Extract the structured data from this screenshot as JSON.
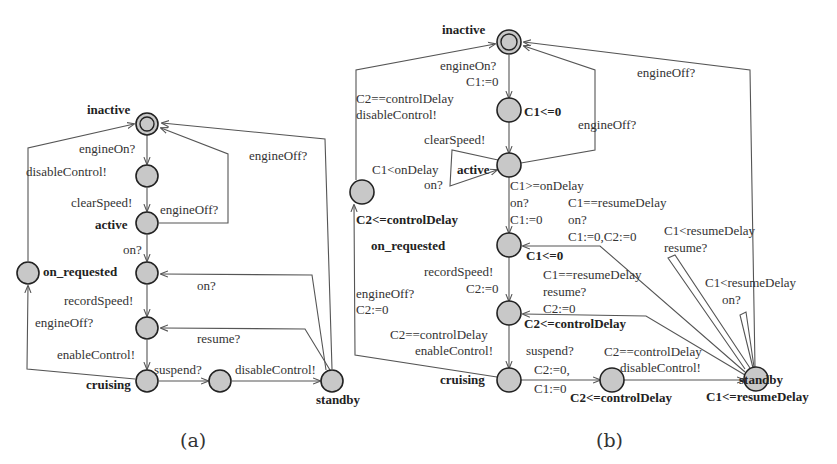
{
  "diagram_a": {
    "caption": "(a)",
    "locations": {
      "inactive": "inactive",
      "active": "active",
      "on_requested": "on_requested",
      "cruising": "cruising",
      "standby": "standby"
    },
    "edges": {
      "engineOn": "engineOn?",
      "disableControl_left": "disableControl!",
      "clearSpeed": "clearSpeed!",
      "engineOff_active": "engineOff?",
      "engineOff_top": "engineOff?",
      "on": "on?",
      "on_standby": "on?",
      "recordSpeed": "recordSpeed!",
      "engineOff_left": "engineOff?",
      "resume": "resume?",
      "enableControl": "enableControl!",
      "suspend": "suspend?",
      "disableControl_bottom": "disableControl!"
    }
  },
  "diagram_b": {
    "caption": "(b)",
    "locations": {
      "inactive": "inactive",
      "inv_c1_zero": "C1<=0",
      "active": "active",
      "on_requested": "on_requested",
      "inv_on_requested": "C1<=0",
      "inv_left": "C2<=controlDelay",
      "inv_mid2": "C2<=controlDelay",
      "cruising": "cruising",
      "inv_mid3": "C2<=controlDelay",
      "standby": "standby",
      "inv_standby": "C1<=resumeDelay"
    },
    "edges": {
      "engineOn_1": "engineOn?",
      "engineOn_2": "C1:=0",
      "left_guard": "C2==controlDelay",
      "left_sync": "disableControl!",
      "clearSpeed": "clearSpeed!",
      "engineOff_active": "engineOff?",
      "engineOff_top": "engineOff?",
      "loop_guard": "C1<onDelay",
      "loop_sync": "on?",
      "on_guard": "C1>=onDelay",
      "on_sync": "on?",
      "on_reset": "C1:=0",
      "standby_on_guard": "C1==resumeDelay",
      "standby_on_sync": "on?",
      "standby_on_reset": "C1:=0,C2:=0",
      "loop_resume_guard": "C1<resumeDelay",
      "loop_resume_sync": "resume?",
      "resume_guard": "C1==resumeDelay",
      "resume_sync": "resume?",
      "resume_reset": "C2:=0",
      "loop_on_guard": "C1<resumeDelay",
      "loop_on_sync": "on?",
      "recordSpeed": "recordSpeed!",
      "recordSpeed_reset": "C2:=0",
      "engineOff_left": "engineOff?",
      "engineOff_left_reset": "C2:=0",
      "enable_guard": "C2==controlDelay",
      "enable_sync": "enableControl!",
      "suspend": "suspend?",
      "suspend_reset1": "C2:=0,",
      "suspend_reset2": "C1:=0",
      "disable_guard": "C2==controlDelay",
      "disable_sync": "disableControl!"
    }
  }
}
